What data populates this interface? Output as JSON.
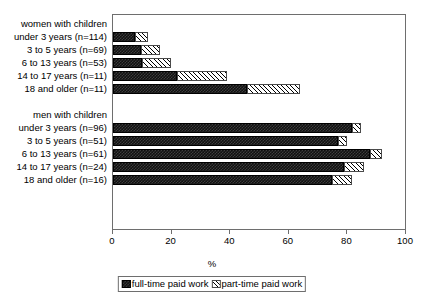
{
  "chart_data": {
    "type": "bar",
    "orientation": "horizontal",
    "stacked": true,
    "title": "",
    "xlabel": "%",
    "ylabel": "",
    "xlim": [
      0,
      100
    ],
    "xticks": [
      0,
      20,
      40,
      60,
      80,
      100
    ],
    "grid": false,
    "legend_position": "bottom",
    "series": [
      {
        "name": "full-time paid work",
        "values": [
          7.5,
          9.5,
          10.0,
          22.0,
          46.0,
          82.0,
          77.0,
          88.0,
          79.0,
          75.0
        ]
      },
      {
        "name": "part-time paid work",
        "values": [
          4.5,
          6.5,
          10.0,
          17.0,
          18.0,
          3.0,
          3.0,
          4.0,
          7.0,
          7.0
        ]
      }
    ],
    "categories": [
      "under 3 years (n=114)",
      "3 to 5 years (n=69)",
      "6 to 13 years (n=53)",
      "14 to 17 years (n=11)",
      "18 and older (n=11)",
      "under 3 years (n=96)",
      "3 to 5 years (n=51)",
      "6 to 13 years (n=61)",
      "14 to 17 years (n=24)",
      "18 and older (n=16)"
    ],
    "group_headers": [
      "women with children",
      "men with children"
    ],
    "rows": [
      {
        "kind": "header",
        "label": "women with children"
      },
      {
        "kind": "data",
        "label": "under 3 years (n=114)",
        "full": 7.5,
        "part": 4.5,
        "total": 12.0
      },
      {
        "kind": "data",
        "label": "3 to 5 years (n=69)",
        "full": 9.5,
        "part": 6.5,
        "total": 16.0
      },
      {
        "kind": "data",
        "label": "6 to 13 years (n=53)",
        "full": 10.0,
        "part": 10.0,
        "total": 20.0
      },
      {
        "kind": "data",
        "label": "14 to 17 years (n=11)",
        "full": 22.0,
        "part": 17.0,
        "total": 39.0
      },
      {
        "kind": "data",
        "label": "18 and older (n=11)",
        "full": 46.0,
        "part": 18.0,
        "total": 64.0
      },
      {
        "kind": "spacer",
        "label": ""
      },
      {
        "kind": "header",
        "label": "men with children"
      },
      {
        "kind": "data",
        "label": "under 3 years (n=96)",
        "full": 82.0,
        "part": 3.0,
        "total": 85.0
      },
      {
        "kind": "data",
        "label": "3 to 5 years (n=51)",
        "full": 77.0,
        "part": 3.0,
        "total": 80.0
      },
      {
        "kind": "data",
        "label": "6 to 13 years (n=61)",
        "full": 88.0,
        "part": 4.0,
        "total": 92.0
      },
      {
        "kind": "data",
        "label": "14 to 17 years (n=24)",
        "full": 79.0,
        "part": 7.0,
        "total": 86.0
      },
      {
        "kind": "data",
        "label": "18 and older (n=16)",
        "full": 75.0,
        "part": 7.0,
        "total": 82.0
      }
    ]
  },
  "axis": {
    "tick_labels": [
      "0",
      "20",
      "40",
      "60",
      "80",
      "100"
    ],
    "title": "%"
  },
  "legend": {
    "items": [
      {
        "label": "full-time paid work",
        "pattern": "dark-checkerboard",
        "color": "#111111"
      },
      {
        "label": "part-time paid work",
        "pattern": "light-diagonal-hatch",
        "color": "#ffffff"
      }
    ]
  },
  "colors": {
    "full_time": "#111111",
    "part_time": "#ffffff",
    "frame": "#6e6e6e",
    "background": "#ffffff",
    "text": "#000000"
  }
}
